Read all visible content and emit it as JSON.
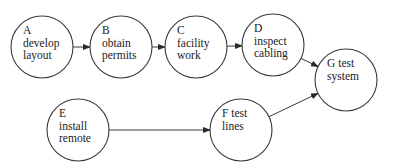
{
  "diagram": {
    "type": "activity-network",
    "nodes": [
      {
        "id": "A",
        "lines": [
          "A",
          "develop",
          "layout"
        ],
        "cx": 42,
        "cy": 47,
        "r": 31
      },
      {
        "id": "B",
        "lines": [
          "B",
          "obtain",
          "permits"
        ],
        "cx": 121,
        "cy": 47,
        "r": 31
      },
      {
        "id": "C",
        "lines": [
          "C",
          "facility",
          "work"
        ],
        "cx": 196,
        "cy": 47,
        "r": 31
      },
      {
        "id": "D",
        "lines": [
          "D",
          "inspect",
          "cabling"
        ],
        "cx": 273,
        "cy": 45,
        "r": 31
      },
      {
        "id": "E",
        "lines": [
          "E",
          "install",
          "remote"
        ],
        "cx": 78,
        "cy": 130,
        "r": 31
      },
      {
        "id": "F",
        "lines": [
          "F test",
          "lines"
        ],
        "cx": 241,
        "cy": 130,
        "r": 31
      },
      {
        "id": "G",
        "lines": [
          "G test",
          "system"
        ],
        "cx": 346,
        "cy": 80,
        "r": 31
      }
    ],
    "edges": [
      {
        "from": "A",
        "to": "B"
      },
      {
        "from": "B",
        "to": "C"
      },
      {
        "from": "C",
        "to": "D"
      },
      {
        "from": "D",
        "to": "G"
      },
      {
        "from": "E",
        "to": "F"
      },
      {
        "from": "F",
        "to": "G"
      }
    ],
    "colors": {
      "stroke": "#3a3a3a",
      "text": "#222222",
      "background": "#ffffff"
    }
  }
}
